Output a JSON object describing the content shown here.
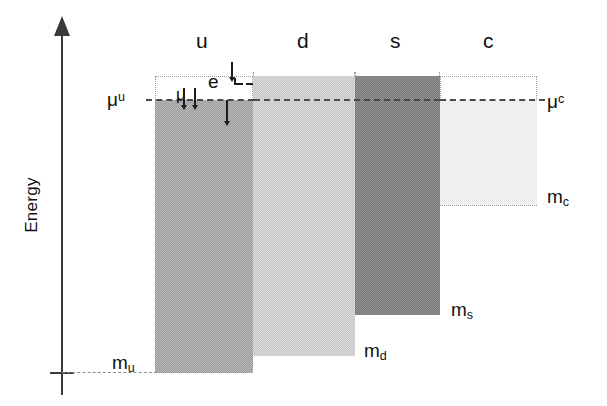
{
  "figure": {
    "type": "energy-level-diagram",
    "axis": {
      "y_label": "Energy",
      "y_arrow": "up-arrow",
      "baseline_tick": true
    },
    "columns": [
      {
        "id": "u",
        "header": "u",
        "fill_color": "#9c9c9c",
        "top_label": "μ",
        "top_label_sup": "u",
        "bottom_label": "m",
        "bottom_label_sub": "u",
        "x": 155,
        "width": 98,
        "well_top": 76,
        "fill_top": 100,
        "bottom": 373
      },
      {
        "id": "d",
        "header": "d",
        "fill_color": "#c6c6c6",
        "top_label": "",
        "top_label_sup": "",
        "bottom_label": "m",
        "bottom_label_sub": "d",
        "x": 253,
        "width": 102,
        "well_top": 76,
        "fill_top": 76,
        "bottom": 356
      },
      {
        "id": "s",
        "header": "s",
        "fill_color": "#767676",
        "top_label": "",
        "top_label_sup": "",
        "bottom_label": "m",
        "bottom_label_sub": "s",
        "x": 355,
        "width": 85,
        "well_top": 76,
        "fill_top": 76,
        "bottom": 315
      },
      {
        "id": "c",
        "header": "c",
        "fill_color": "#e9e9e9",
        "top_label": "μ",
        "top_label_sup": "c",
        "bottom_label": "m",
        "bottom_label_sub": "c",
        "x": 440,
        "width": 97,
        "well_top": 76,
        "fill_top": 100,
        "bottom": 205
      }
    ],
    "labels": {
      "mu_u": "μ",
      "mu_u_sup": "u",
      "mu_c": "μ",
      "mu_c_sup": "c",
      "m_u": "m",
      "m_u_sub": "u",
      "m_d": "m",
      "m_d_sub": "d",
      "m_s": "m",
      "m_s_sub": "s",
      "m_c": "m",
      "m_c_sub": "c"
    },
    "annotation": {
      "electron_label": "e",
      "mu_glyph": "μ",
      "in_arrow": "down-arrow",
      "out_arrow": "down-arrow"
    },
    "chemical_potential_line": {
      "y": 100,
      "style": "dashed",
      "color": "#4a4a4a"
    },
    "baseline": {
      "y": 373,
      "style": "dashed",
      "color": "#8d8d8d"
    }
  }
}
